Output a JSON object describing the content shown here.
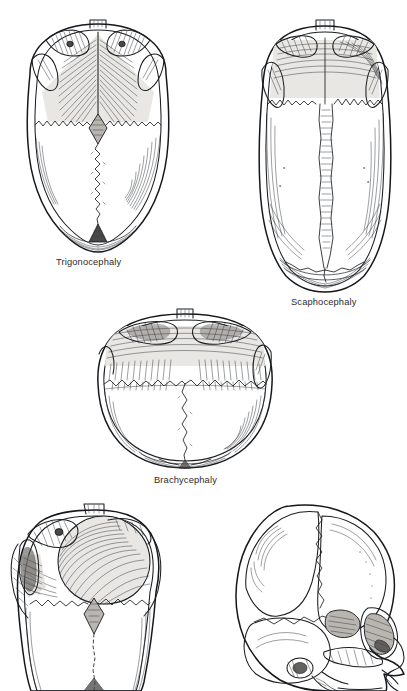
{
  "page": {
    "background_color": "#ffffff",
    "ink_color": "#15171a",
    "caption_color": "#2b2b2b",
    "width": 407,
    "height": 691,
    "media": "pen-and-ink line drawing, hatched shading"
  },
  "figures": [
    {
      "id": "trigonocephaly",
      "caption": "Trigonocephaly",
      "view": "vertex (top-down) view",
      "position": "top-left",
      "description": "Triangular keel-shaped forehead from metopic suture fusion; narrow pointed frontal region with biparietal widening posteriorly.",
      "fused_suture": "metopic",
      "features": [
        "keel-shaped midline frontal ridge",
        "hypotelorism with narrowed anterior fossa",
        "open anterior fontanelle (diamond)",
        "patent sagittal suture",
        "coronal sutures visible bilaterally",
        "posterior fontanelle visible"
      ]
    },
    {
      "id": "scaphocephaly",
      "caption": "Scaphocephaly",
      "view": "vertex (top-down) view",
      "position": "top-right",
      "description": "Long narrow boat-shaped cranium from sagittal suture fusion; increased anteroposterior length with biparietal narrowing.",
      "fused_suture": "sagittal",
      "features": [
        "elongated anteroposterior vault",
        "narrow biparietal diameter",
        "ridged fused sagittal suture",
        "frontal bossing anteriorly",
        "occipital prominence posteriorly",
        "patent coronal sutures"
      ]
    },
    {
      "id": "brachycephaly",
      "caption": "Brachycephaly",
      "view": "vertex (top-down) view",
      "position": "middle-center",
      "description": "Short wide cranium from bilateral coronal suture fusion; reduced anteroposterior length with marked biparietal widening.",
      "fused_suture": "bilateral coronal",
      "features": [
        "shortened anteroposterior diameter",
        "markedly widened biparietal diameter",
        "recessed flattened forehead",
        "ridged fused coronal sutures",
        "patent sagittal suture",
        "prominent orbital rims"
      ]
    },
    {
      "id": "plagiocephaly",
      "caption": "",
      "view": "vertex (top-down) oblique view",
      "position": "bottom-left",
      "description": "Asymmetric cranium with unilateral frontal flattening and contralateral frontal bossing; image cropped at lower page edge.",
      "fused_suture": "unilateral coronal",
      "features": [
        "ipsilateral frontal flattening",
        "contralateral frontal bossing",
        "deviated midline and nasal root",
        "elevated ipsilateral orbit",
        "open anterior fontanelle",
        "patent sagittal suture"
      ],
      "cropped": true
    },
    {
      "id": "lateral-oblique",
      "caption": "",
      "view": "lateral oblique view",
      "position": "bottom-right",
      "description": "Side oblique view of an infant skull showing vault bones, sutures, orbit, zygomatic arch and maxilla; image cropped at lower page edge.",
      "features": [
        "frontal bone with bossing",
        "parietal bone",
        "coronal suture",
        "squamous temporal bone",
        "greater wing of sphenoid (pterion)",
        "orbital rim and orbit",
        "zygomatic arch",
        "external acoustic meatus",
        "mastoid region",
        "maxilla and nasal aperture"
      ],
      "cropped": true
    }
  ],
  "captions_visible": [
    "Trigonocephaly",
    "Scaphocephaly",
    "Brachycephaly"
  ]
}
